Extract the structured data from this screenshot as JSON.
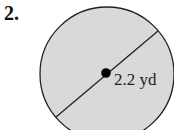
{
  "problem": {
    "number": "2."
  },
  "figure": {
    "shape": "circle",
    "fill_color": "#d9d9d9",
    "stroke_color": "#222222",
    "segment": "diameter",
    "radius_label": "2.2 yd"
  }
}
